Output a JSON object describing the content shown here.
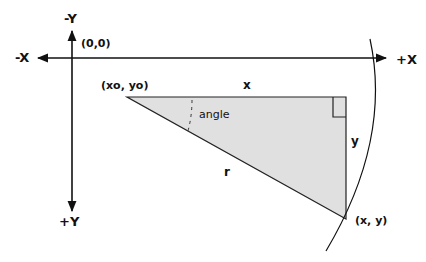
{
  "diagram": {
    "type": "coordinate-geometry",
    "axes": {
      "neg_y_label": "-Y",
      "pos_y_label": "+Y",
      "neg_x_label": "-X",
      "pos_x_label": "+X",
      "origin_label": "(0,0)"
    },
    "points": {
      "start_label": "(xo, yo)",
      "end_label": "(x, y)"
    },
    "triangle": {
      "horizontal_side_label": "x",
      "vertical_side_label": "y",
      "hypotenuse_label": "r",
      "angle_label": "angle",
      "fill_color": "#e0e0e0",
      "stroke_color": "#222222"
    },
    "arc": {
      "description": "circle arc of radius r centered at (xo, yo)"
    }
  }
}
